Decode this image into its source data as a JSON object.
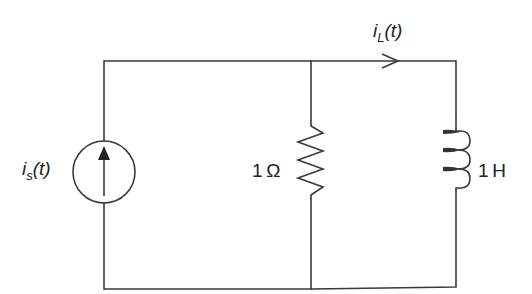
{
  "diagram": {
    "type": "circuit-schematic",
    "colors": {
      "wire": "#3a3a3a",
      "background": "#ffffff",
      "text": "#222222"
    },
    "components": [
      {
        "id": "source",
        "kind": "current-source",
        "symbol": "i",
        "subscript": "s",
        "arg": "(t)",
        "direction": "up"
      },
      {
        "id": "resistor",
        "kind": "resistor",
        "label": "1 Ω"
      },
      {
        "id": "inductor",
        "kind": "inductor",
        "label": "1 H"
      }
    ],
    "currents": [
      {
        "id": "inductor-current",
        "symbol": "i",
        "subscript": "L",
        "arg": "(t)",
        "direction": "right"
      }
    ],
    "labels": {
      "source_symbol": "i",
      "source_sub": "s",
      "source_arg": "(t)",
      "resistor": "1 Ω",
      "inductor": "1 H",
      "current_symbol": "i",
      "current_sub": "L",
      "current_arg": "(t)"
    }
  }
}
